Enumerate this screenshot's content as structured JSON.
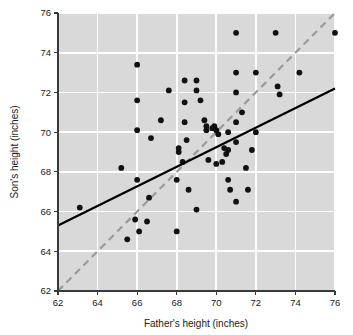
{
  "chart_data": {
    "type": "scatter",
    "title": "",
    "xlabel": "Father's height (inches)",
    "ylabel": "Son's height (inches)",
    "xlim": [
      62,
      76
    ],
    "ylim": [
      62,
      76
    ],
    "xticks": [
      62,
      64,
      66,
      68,
      70,
      72,
      74,
      76
    ],
    "yticks": [
      62,
      64,
      66,
      68,
      70,
      72,
      74,
      76
    ],
    "xtick_labels": [
      "62",
      "64",
      "66",
      "68",
      "70",
      "72",
      "74",
      "76"
    ],
    "ytick_labels": [
      "62",
      "64",
      "66",
      "68",
      "70",
      "72",
      "74",
      "76"
    ],
    "grid": true,
    "legend": "none",
    "plot_background_color": "#d9d9d9",
    "grid_color": "#ffffff",
    "point_color": "#111111",
    "regression_line_color": "#000000",
    "reference_line_color": "#9a9a9a",
    "series": [
      {
        "name": "Father-son height pairs",
        "marker": "filled-circle",
        "points": [
          [
            63.1,
            66.2
          ],
          [
            65.2,
            68.2
          ],
          [
            65.5,
            64.6
          ],
          [
            65.9,
            65.6
          ],
          [
            66.0,
            73.4
          ],
          [
            66.0,
            70.1
          ],
          [
            66.0,
            71.6
          ],
          [
            66.0,
            67.6
          ],
          [
            66.1,
            65.0
          ],
          [
            66.5,
            65.5
          ],
          [
            66.6,
            66.7
          ],
          [
            66.7,
            69.7
          ],
          [
            67.2,
            70.6
          ],
          [
            67.6,
            72.1
          ],
          [
            68.0,
            65.0
          ],
          [
            68.0,
            67.6
          ],
          [
            68.1,
            69.2
          ],
          [
            68.1,
            69.0
          ],
          [
            68.3,
            68.5
          ],
          [
            68.4,
            72.6
          ],
          [
            68.4,
            71.5
          ],
          [
            68.4,
            70.5
          ],
          [
            68.5,
            69.6
          ],
          [
            68.6,
            67.1
          ],
          [
            69.0,
            66.1
          ],
          [
            69.0,
            72.6
          ],
          [
            69.0,
            72.1
          ],
          [
            69.2,
            71.6
          ],
          [
            69.4,
            70.6
          ],
          [
            69.5,
            70.3
          ],
          [
            69.5,
            70.1
          ],
          [
            69.6,
            68.6
          ],
          [
            69.8,
            70.2
          ],
          [
            69.9,
            70.3
          ],
          [
            70.0,
            70.1
          ],
          [
            70.0,
            68.4
          ],
          [
            70.1,
            69.9
          ],
          [
            70.3,
            68.5
          ],
          [
            70.4,
            69.2
          ],
          [
            70.5,
            68.9
          ],
          [
            70.6,
            67.6
          ],
          [
            70.6,
            69.1
          ],
          [
            70.6,
            70.0
          ],
          [
            70.7,
            67.1
          ],
          [
            71.0,
            75.0
          ],
          [
            71.0,
            73.0
          ],
          [
            71.0,
            72.0
          ],
          [
            71.0,
            70.5
          ],
          [
            71.0,
            69.5
          ],
          [
            71.0,
            66.5
          ],
          [
            71.3,
            71.0
          ],
          [
            71.5,
            68.2
          ],
          [
            71.6,
            67.1
          ],
          [
            71.8,
            69.1
          ],
          [
            72.0,
            70.0
          ],
          [
            72.0,
            73.0
          ],
          [
            73.0,
            75.0
          ],
          [
            73.1,
            72.3
          ],
          [
            73.2,
            71.9
          ],
          [
            74.2,
            73.0
          ],
          [
            76.0,
            75.0
          ]
        ]
      }
    ],
    "lines": [
      {
        "name": "regression-line",
        "style": "solid",
        "color": "#000000",
        "from": [
          62,
          65.3
        ],
        "to": [
          76,
          72.2
        ]
      },
      {
        "name": "reference-line",
        "style": "dashed",
        "color": "#9a9a9a",
        "from": [
          62,
          62
        ],
        "to": [
          76,
          76
        ]
      }
    ]
  }
}
